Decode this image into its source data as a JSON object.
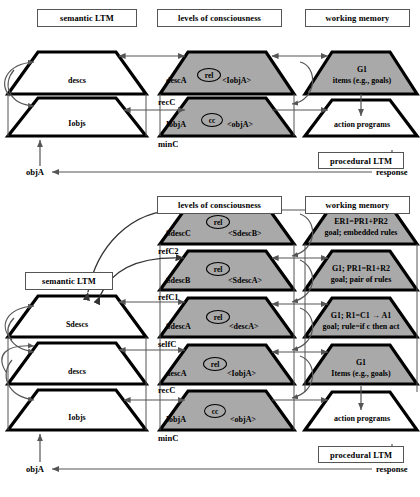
{
  "headers": {
    "top": [
      {
        "key": "semantic-ltm",
        "label": "semantic LTM"
      },
      {
        "key": "levels-of-consciousness",
        "label": "levels of consciousness"
      },
      {
        "key": "working-memory",
        "label": "working memory"
      }
    ],
    "bottom": [
      {
        "key": "levels-of-consciousness",
        "label": "levels of consciousness"
      },
      {
        "key": "working-memory",
        "label": "working memory"
      }
    ],
    "bottom_semantic": "semantic LTM"
  },
  "top_panel": {
    "ltm": [
      {
        "key": "descs",
        "label": "descs",
        "fill": "white"
      },
      {
        "key": "iobjs",
        "label": "Iobjs",
        "fill": "white"
      }
    ],
    "consciousness": [
      {
        "key": "descA",
        "left": "descA",
        "ellipse": "rel",
        "right": "<IobjA>",
        "level": "recC",
        "fill": "gray"
      },
      {
        "key": "iobjA",
        "left": "IobjA",
        "ellipse": "cc",
        "right": "<objA>",
        "level": "minC",
        "fill": "gray"
      }
    ],
    "working_memory": [
      {
        "key": "g1-items",
        "line1": "G1",
        "line2": "items (e.g., goals)",
        "fill": "gray"
      },
      {
        "key": "action-programs",
        "line1": "",
        "line2": "action programs",
        "fill": "white"
      }
    ],
    "procedural_ltm": "procedural LTM",
    "input_label": "objA",
    "output_label": "response"
  },
  "bottom_panel": {
    "ltm": [
      {
        "key": "sdescs",
        "label": "Sdescs",
        "fill": "white"
      },
      {
        "key": "descs",
        "label": "descs",
        "fill": "white"
      },
      {
        "key": "iobjs",
        "label": "Iobjs",
        "fill": "white"
      }
    ],
    "consciousness": [
      {
        "key": "sdescC",
        "left": "SdescC",
        "ellipse": "rel",
        "right": "<SdescB>",
        "level": "refC2",
        "fill": "gray"
      },
      {
        "key": "sdescB",
        "left": "SdescB",
        "ellipse": "rel",
        "right": "<SdescA>",
        "level": "refC1",
        "fill": "gray"
      },
      {
        "key": "sdescA",
        "left": "SdescA",
        "ellipse": "rel",
        "right": "<descA>",
        "level": "selfC",
        "fill": "gray"
      },
      {
        "key": "descA",
        "left": "descA",
        "ellipse": "rel",
        "right": "<IobjA>",
        "level": "recC",
        "fill": "gray"
      },
      {
        "key": "iobjA",
        "left": "IobjA",
        "ellipse": "cc",
        "right": "<objA>",
        "level": "minC",
        "fill": "gray"
      }
    ],
    "working_memory": [
      {
        "key": "er1",
        "line1": "ER1=PR1+PR2",
        "line2": "goal; embedded rules",
        "fill": "gray"
      },
      {
        "key": "pr1",
        "line1": "G1; PR1=R1+R2",
        "line2": "goal; pair of rules",
        "fill": "gray"
      },
      {
        "key": "r1",
        "line1": "G1; R1=C1 → A1",
        "line2": "goal; rule=if c then act",
        "fill": "gray"
      },
      {
        "key": "g1-items",
        "line1": "G1",
        "line2": "Items (e.g., goals)",
        "fill": "gray"
      },
      {
        "key": "action-programs",
        "line1": "",
        "line2": "action programs",
        "fill": "white"
      }
    ],
    "procedural_ltm": "procedural LTM",
    "input_label": "objA",
    "output_label": "response"
  },
  "colors": {
    "gray_fill": "#a9a9a9",
    "white_fill": "#ffffff",
    "stroke": "#000000",
    "thin_arrow": "#555555"
  }
}
